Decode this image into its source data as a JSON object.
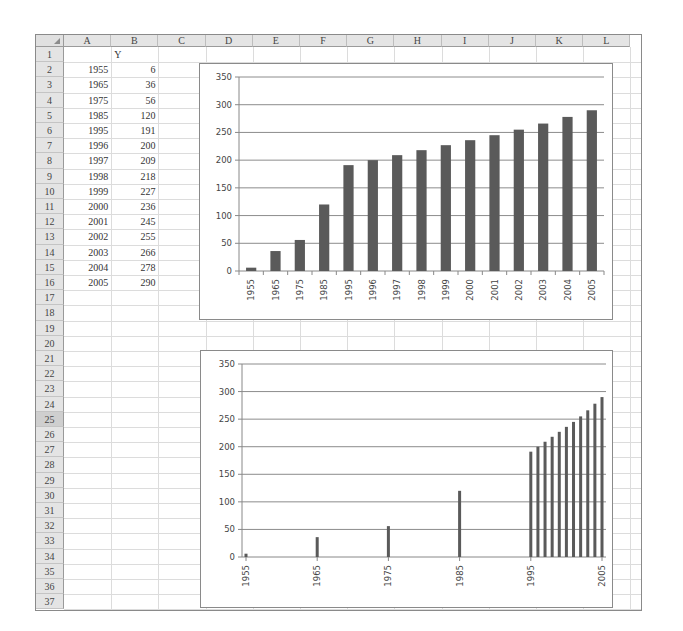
{
  "sheet": {
    "columns": [
      "A",
      "B",
      "C",
      "D",
      "E",
      "F",
      "G",
      "H",
      "I",
      "J",
      "K",
      "L"
    ],
    "row_count": 37,
    "selected_row": 25,
    "header_row": {
      "B": "Y"
    },
    "rows": [
      {
        "row": 2,
        "A": "1955",
        "B": "6"
      },
      {
        "row": 3,
        "A": "1965",
        "B": "36"
      },
      {
        "row": 4,
        "A": "1975",
        "B": "56"
      },
      {
        "row": 5,
        "A": "1985",
        "B": "120"
      },
      {
        "row": 6,
        "A": "1995",
        "B": "191"
      },
      {
        "row": 7,
        "A": "1996",
        "B": "200"
      },
      {
        "row": 8,
        "A": "1997",
        "B": "209"
      },
      {
        "row": 9,
        "A": "1998",
        "B": "218"
      },
      {
        "row": 10,
        "A": "1999",
        "B": "227"
      },
      {
        "row": 11,
        "A": "2000",
        "B": "236"
      },
      {
        "row": 12,
        "A": "2001",
        "B": "245"
      },
      {
        "row": 13,
        "A": "2002",
        "B": "255"
      },
      {
        "row": 14,
        "A": "2003",
        "B": "266"
      },
      {
        "row": 15,
        "A": "2004",
        "B": "278"
      },
      {
        "row": 16,
        "A": "2005",
        "B": "290"
      }
    ]
  },
  "colors": {
    "bar": "#5a5a5a",
    "gridline": "#8c8c8c",
    "axis": "#888888"
  },
  "chart_data": [
    {
      "type": "bar",
      "title": "",
      "xaxis_type": "category",
      "categories": [
        "1955",
        "1965",
        "1975",
        "1985",
        "1995",
        "1996",
        "1997",
        "1998",
        "1999",
        "2000",
        "2001",
        "2002",
        "2003",
        "2004",
        "2005"
      ],
      "series": [
        {
          "name": "Y",
          "values": [
            6,
            36,
            56,
            120,
            191,
            200,
            209,
            218,
            227,
            236,
            245,
            255,
            266,
            278,
            290
          ]
        }
      ],
      "xlabel": "",
      "ylabel": "",
      "ylim": [
        0,
        350
      ],
      "yticks": [
        0,
        50,
        100,
        150,
        200,
        250,
        300,
        350
      ],
      "grid": true,
      "legend": "none"
    },
    {
      "type": "bar",
      "title": "",
      "xaxis_type": "date",
      "x": [
        1955,
        1965,
        1975,
        1985,
        1995,
        1996,
        1997,
        1998,
        1999,
        2000,
        2001,
        2002,
        2003,
        2004,
        2005
      ],
      "series": [
        {
          "name": "Y",
          "values": [
            6,
            36,
            56,
            120,
            191,
            200,
            209,
            218,
            227,
            236,
            245,
            255,
            266,
            278,
            290
          ]
        }
      ],
      "xticks": [
        "1955",
        "1965",
        "1975",
        "1985",
        "1995",
        "2005"
      ],
      "xlim": [
        1955,
        2005
      ],
      "xlabel": "",
      "ylabel": "",
      "ylim": [
        0,
        350
      ],
      "yticks": [
        0,
        50,
        100,
        150,
        200,
        250,
        300,
        350
      ],
      "grid": true,
      "legend": "none"
    }
  ]
}
